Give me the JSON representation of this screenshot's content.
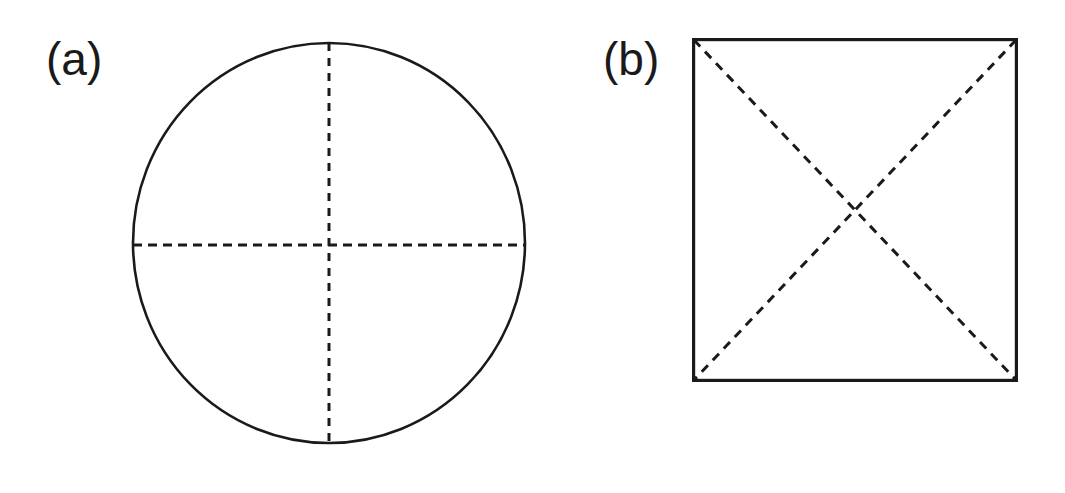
{
  "figure": {
    "background_color": "#ffffff",
    "stroke_color": "#1a1a1a",
    "width": 1065,
    "height": 493,
    "panels": [
      {
        "id": "a",
        "label": "(a)",
        "shape": "circle",
        "description": "circle with dashed vertical and horizontal diameters",
        "center_x": 329,
        "center_y": 243,
        "radius_x": 196,
        "radius_y": 200,
        "outline_style": "solid",
        "outline_width": 2.6,
        "dividers": [
          {
            "name": "vertical-diameter",
            "style": "dashed",
            "x1": 329,
            "y1": 43,
            "x2": 329,
            "y2": 443,
            "dash": 8,
            "gap": 7,
            "width": 3
          },
          {
            "name": "horizontal-diameter",
            "style": "dashed",
            "x1": 133,
            "y1": 245,
            "x2": 525,
            "y2": 245,
            "dash": 9,
            "gap": 6,
            "width": 3
          }
        ]
      },
      {
        "id": "b",
        "label": "(b)",
        "shape": "square",
        "description": "square with dashed diagonals forming an X",
        "left": 692,
        "top": 38,
        "right": 1018,
        "bottom": 382,
        "outline_style": "solid",
        "outline_width": 3.2,
        "dividers": [
          {
            "name": "diagonal-top-left-to-bottom-right",
            "style": "dashed",
            "x1": 694,
            "y1": 40,
            "x2": 1016,
            "y2": 380,
            "dash": 9,
            "gap": 7,
            "width": 3
          },
          {
            "name": "diagonal-top-right-to-bottom-left",
            "style": "dashed",
            "x1": 1016,
            "y1": 40,
            "x2": 694,
            "y2": 380,
            "dash": 9,
            "gap": 7,
            "width": 3
          }
        ]
      }
    ]
  }
}
